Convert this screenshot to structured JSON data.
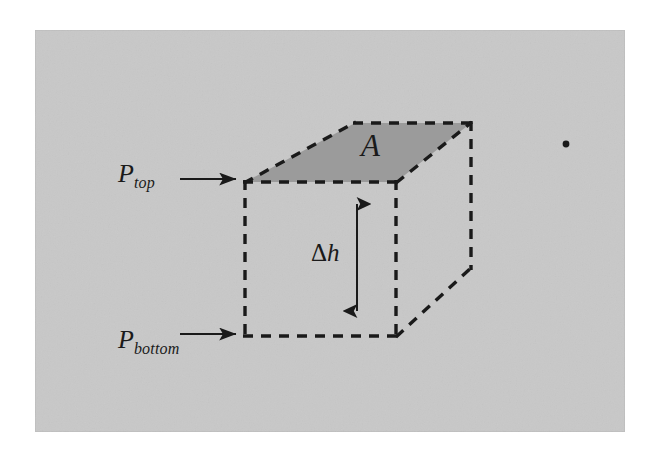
{
  "figure": {
    "type": "physics-diagram",
    "canvas": {
      "width": 648,
      "height": 455,
      "background": "#ffffff"
    },
    "panel": {
      "name": "gray-background-panel",
      "x": 35,
      "y": 30,
      "width": 590,
      "height": 402,
      "fill": "#c8c8c8"
    },
    "colors": {
      "background": "#ffffff",
      "panel": "#c8c8c8",
      "top_face_fill": "#9b9b9b",
      "ink": "#1a1a1a"
    },
    "cube": {
      "name": "fluid-element-cube",
      "front_face": {
        "left": 245,
        "right": 396,
        "top": 182,
        "bottom": 336
      },
      "depth_offset": {
        "dx": 75,
        "dy": -59
      },
      "stroke": "#1a1a1a",
      "stroke_width": 3,
      "dash": "9 9",
      "vertices": {
        "front_top_left": [
          245,
          182
        ],
        "front_top_right": [
          396,
          182
        ],
        "front_bottom_left": [
          245,
          336
        ],
        "front_bottom_right": [
          396,
          336
        ],
        "back_top_left": [
          355,
          123
        ],
        "back_top_right": [
          471,
          123
        ],
        "back_bottom_right": [
          471,
          268
        ]
      }
    },
    "top_face": {
      "name": "shaded-area-face",
      "label": "A",
      "fill": "#9b9b9b",
      "polygon": "245,182 355,123 471,123 396,182"
    },
    "height_arrow": {
      "name": "delta-h-dimension-arrow",
      "label_delta": "Δ",
      "label_h": "h",
      "label": "Δh",
      "x": 357,
      "y_top": 204,
      "y_bottom": 311,
      "double_headed": true
    },
    "pressure_labels": [
      {
        "name": "p-top",
        "symbol": "P",
        "subscript": "top",
        "text": "P top",
        "arrow": {
          "x_start": 180,
          "x_end": 242,
          "y": 179
        }
      },
      {
        "name": "p-bottom",
        "symbol": "P",
        "subscript": "bottom",
        "text": "P bottom",
        "arrow": {
          "x_start": 180,
          "x_end": 242,
          "y": 334
        }
      }
    ],
    "stray_mark": {
      "name": "stray-dot",
      "x": 566,
      "y": 144,
      "r": 3.4,
      "fill": "#1a1a1a"
    }
  }
}
